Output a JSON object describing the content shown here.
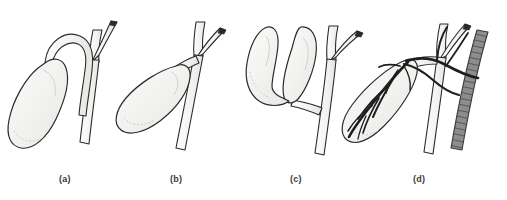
{
  "figure": {
    "type": "medical-line-illustration",
    "background_color": "#ffffff",
    "ink_color": "#2b2b2b",
    "organ_fill_color": "#f3f3f1",
    "duct_fill_color": "#f5f5f3",
    "vein_fill_color": "#8a8a8a",
    "artery_color": "#1e1e1e"
  },
  "panels": [
    {
      "id": "a",
      "caption": "(a)",
      "description": "Elongated gallbladder with a long, looping cystic duct that arcs over the neck, descends and runs parallel alongside the common hepatic duct before a low insertion",
      "structures": [
        "gallbladder",
        "cystic-duct",
        "right-hepatic-duct",
        "left-hepatic-duct",
        "common-hepatic-duct",
        "common-bile-duct"
      ]
    },
    {
      "id": "b",
      "caption": "(b)",
      "description": "Gallbladder with a very short or absent cystic duct, the neck inserting high at the junction of the hepatic ducts",
      "structures": [
        "gallbladder",
        "short-cystic-duct",
        "right-hepatic-duct",
        "left-hepatic-duct",
        "common-hepatic-duct",
        "common-bile-duct"
      ]
    },
    {
      "id": "c",
      "caption": "(c)",
      "description": "Duplicated (bilobed) gallbladder; two separate sacs converge into a single shared cystic duct draining into the bile duct",
      "structures": [
        "gallbladder-lobe-left",
        "gallbladder-lobe-right",
        "common-cystic-duct",
        "right-hepatic-duct",
        "left-hepatic-duct",
        "common-hepatic-duct",
        "common-bile-duct"
      ]
    },
    {
      "id": "d",
      "caption": "(d)",
      "description": "Gallbladder shown with its arterial supply; the cystic artery branches arborize over the gallbladder wall, the hepatic artery crosses anteriorly and the cross-hatched portal vein lies posteriorly",
      "structures": [
        "gallbladder",
        "cystic-artery-branches",
        "hepatic-artery",
        "cystic-duct",
        "right-hepatic-duct",
        "left-hepatic-duct",
        "common-bile-duct",
        "portal-vein"
      ]
    }
  ]
}
